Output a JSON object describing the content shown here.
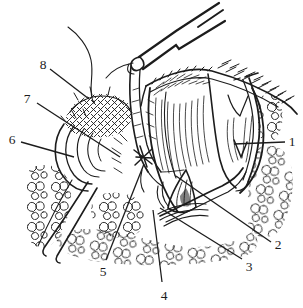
{
  "figure": {
    "labels": [
      {
        "text": "1"
      },
      {
        "text": "2"
      },
      {
        "text": "3"
      },
      {
        "text": "4"
      },
      {
        "text": "5"
      },
      {
        "text": "6"
      },
      {
        "text": "7"
      },
      {
        "text": "8"
      }
    ],
    "colors": {
      "ink": "#1c1c1c",
      "background": "#ffffff"
    }
  }
}
